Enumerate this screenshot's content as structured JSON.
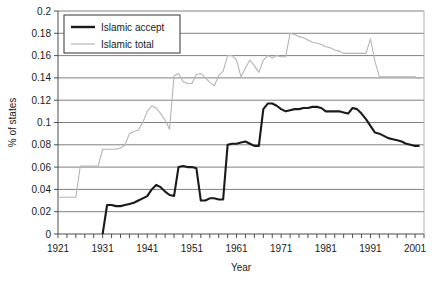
{
  "chart_data": {
    "type": "line",
    "title": "",
    "xlabel": "Year",
    "ylabel": "% of states",
    "xlim": [
      1921,
      2003
    ],
    "ylim": [
      0,
      0.2
    ],
    "grid": true,
    "legend_position": "top-left",
    "ytick_labels": [
      "0.2",
      "0.18",
      "0.16",
      "0.14",
      "0.12",
      "0.1",
      "0.08",
      "0.06",
      "0.04",
      "0.02",
      "0"
    ],
    "ytick_values": [
      0.2,
      0.18,
      0.16,
      0.14,
      0.12,
      0.1,
      0.08,
      0.06,
      0.04,
      0.02,
      0
    ],
    "xtick_labels": [
      "1921",
      "1931",
      "1941",
      "1951",
      "1961",
      "1971",
      "1981",
      "1991",
      "2001"
    ],
    "xtick_values": [
      1921,
      1931,
      1941,
      1951,
      1961,
      1971,
      1981,
      1991,
      2001
    ],
    "series": [
      {
        "name": "Islamic accept",
        "color": "#1a1a1a",
        "width": 2.1,
        "x": [
          1931,
          1932,
          1933,
          1934,
          1935,
          1936,
          1937,
          1938,
          1939,
          1940,
          1941,
          1942,
          1943,
          1944,
          1945,
          1946,
          1947,
          1948,
          1949,
          1950,
          1951,
          1952,
          1953,
          1954,
          1955,
          1956,
          1957,
          1958,
          1959,
          1960,
          1961,
          1962,
          1963,
          1964,
          1965,
          1966,
          1967,
          1968,
          1969,
          1970,
          1971,
          1972,
          1973,
          1974,
          1975,
          1976,
          1977,
          1978,
          1979,
          1980,
          1981,
          1982,
          1983,
          1984,
          1985,
          1986,
          1987,
          1988,
          1989,
          1990,
          1991,
          1992,
          1993,
          1994,
          1995,
          1996,
          1997,
          1998,
          1999,
          2000,
          2001,
          2002
        ],
        "values": [
          0.0,
          0.026,
          0.026,
          0.025,
          0.025,
          0.026,
          0.027,
          0.028,
          0.03,
          0.032,
          0.034,
          0.04,
          0.044,
          0.042,
          0.038,
          0.035,
          0.034,
          0.06,
          0.061,
          0.06,
          0.06,
          0.059,
          0.03,
          0.03,
          0.032,
          0.032,
          0.031,
          0.031,
          0.08,
          0.081,
          0.081,
          0.082,
          0.083,
          0.081,
          0.079,
          0.079,
          0.112,
          0.117,
          0.117,
          0.115,
          0.112,
          0.11,
          0.111,
          0.112,
          0.112,
          0.113,
          0.113,
          0.114,
          0.114,
          0.113,
          0.11,
          0.11,
          0.11,
          0.11,
          0.109,
          0.108,
          0.113,
          0.112,
          0.108,
          0.103,
          0.097,
          0.091,
          0.09,
          0.088,
          0.086,
          0.085,
          0.084,
          0.083,
          0.081,
          0.08,
          0.079,
          0.079
        ]
      },
      {
        "name": "Islamic total",
        "color": "#b5b5b5",
        "width": 1.1,
        "x": [
          1921,
          1922,
          1923,
          1924,
          1925,
          1926,
          1927,
          1928,
          1929,
          1930,
          1931,
          1932,
          1933,
          1934,
          1935,
          1936,
          1937,
          1938,
          1939,
          1940,
          1941,
          1942,
          1943,
          1944,
          1945,
          1946,
          1947,
          1948,
          1949,
          1950,
          1951,
          1952,
          1953,
          1954,
          1955,
          1956,
          1957,
          1958,
          1959,
          1960,
          1961,
          1962,
          1963,
          1964,
          1965,
          1966,
          1967,
          1968,
          1969,
          1970,
          1971,
          1972,
          1973,
          1974,
          1975,
          1976,
          1977,
          1978,
          1979,
          1980,
          1981,
          1982,
          1983,
          1984,
          1985,
          1986,
          1987,
          1988,
          1989,
          1990,
          1991,
          1992,
          1993,
          1994,
          1995,
          1996,
          1997,
          1998,
          1999,
          2000,
          2001,
          2002
        ],
        "values": [
          0.033,
          0.033,
          0.033,
          0.033,
          0.033,
          0.061,
          0.061,
          0.061,
          0.061,
          0.061,
          0.076,
          0.076,
          0.076,
          0.076,
          0.077,
          0.08,
          0.09,
          0.092,
          0.093,
          0.1,
          0.11,
          0.115,
          0.113,
          0.108,
          0.102,
          0.094,
          0.142,
          0.144,
          0.137,
          0.135,
          0.135,
          0.143,
          0.144,
          0.14,
          0.136,
          0.133,
          0.142,
          0.146,
          0.16,
          0.16,
          0.156,
          0.141,
          0.149,
          0.156,
          0.151,
          0.145,
          0.156,
          0.16,
          0.158,
          0.16,
          0.159,
          0.159,
          0.18,
          0.179,
          0.177,
          0.176,
          0.174,
          0.172,
          0.171,
          0.17,
          0.168,
          0.167,
          0.165,
          0.164,
          0.162,
          0.162,
          0.162,
          0.162,
          0.162,
          0.162,
          0.175,
          0.155,
          0.141,
          0.141,
          0.141,
          0.141,
          0.141,
          0.141,
          0.141,
          0.141,
          0.141,
          0.139
        ]
      }
    ]
  },
  "legend": {
    "items": [
      {
        "label": "Islamic accept"
      },
      {
        "label": "Islamic total"
      }
    ]
  }
}
